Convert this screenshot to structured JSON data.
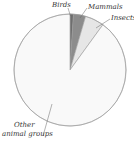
{
  "chart_data": {
    "type": "pie",
    "title": "",
    "slices": [
      {
        "label": "Birds",
        "value": 1,
        "color": "#6e6e6e"
      },
      {
        "label": "Mammals",
        "value": 3.5,
        "color": "#8c8c8c"
      },
      {
        "label": "Insects",
        "value": 5.5,
        "color": "#e6e6e6"
      },
      {
        "label": "Other animal groups",
        "value": 90,
        "color": "#f9f9f9"
      }
    ],
    "labels": {
      "birds": "Birds",
      "mammals": "Mammals",
      "insects": "Insects",
      "other_line1": "Other",
      "other_line2": "animal groups"
    },
    "start_angle": "12 o'clock, clockwise",
    "outline_color": "#9a9a9a"
  }
}
